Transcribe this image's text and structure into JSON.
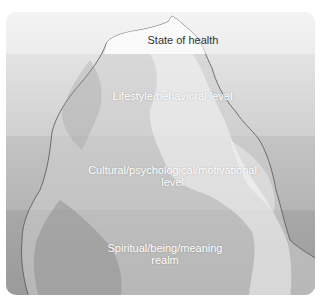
{
  "diagram": {
    "type": "iceberg",
    "levels": [
      {
        "label": "State of health",
        "band_color": "#eeeeee",
        "text_color": "#333333"
      },
      {
        "label": "Lifestyle/behavioral level",
        "band_color": "#d9d9d9",
        "text_color": "#ffffff"
      },
      {
        "label_line1": "Cultural/psychological/motivational",
        "label_line2": "level",
        "band_color": "#bdbdbd",
        "text_color": "#ffffff"
      },
      {
        "label_line1": "Spiritual/being/meaning",
        "label_line2": "realm",
        "band_color": "#a0a0a0",
        "text_color": "#ffffff"
      }
    ]
  }
}
